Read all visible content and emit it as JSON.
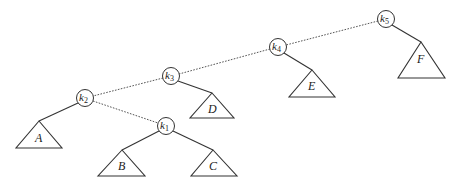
{
  "diagram": {
    "type": "binary-search-tree",
    "nodes": [
      {
        "id": "k5",
        "base": "k",
        "sub": "5",
        "cx": 386,
        "cy": 19
      },
      {
        "id": "k4",
        "base": "k",
        "sub": "4",
        "cx": 278,
        "cy": 47
      },
      {
        "id": "k3",
        "base": "k",
        "sub": "3",
        "cx": 171,
        "cy": 76
      },
      {
        "id": "k2",
        "base": "k",
        "sub": "2",
        "cx": 85,
        "cy": 98
      },
      {
        "id": "k1",
        "base": "k",
        "sub": "1",
        "cx": 166,
        "cy": 126
      }
    ],
    "subtrees": [
      {
        "id": "A",
        "label": "A",
        "parent": "k2",
        "side": "left"
      },
      {
        "id": "B",
        "label": "B",
        "parent": "k1",
        "side": "left"
      },
      {
        "id": "C",
        "label": "C",
        "parent": "k1",
        "side": "right"
      },
      {
        "id": "D",
        "label": "D",
        "parent": "k3",
        "side": "right"
      },
      {
        "id": "E",
        "label": "E",
        "parent": "k4",
        "side": "right"
      },
      {
        "id": "F",
        "label": "F",
        "parent": "k5",
        "side": "right"
      }
    ],
    "edges": [
      {
        "from": "k5",
        "to": "k4",
        "style": "dotted"
      },
      {
        "from": "k4",
        "to": "k3",
        "style": "dotted"
      },
      {
        "from": "k3",
        "to": "k2",
        "style": "dotted"
      },
      {
        "from": "k2",
        "to": "k1",
        "style": "dotted"
      },
      {
        "from": "k2",
        "to": "A",
        "style": "solid"
      },
      {
        "from": "k1",
        "to": "B",
        "style": "solid"
      },
      {
        "from": "k1",
        "to": "C",
        "style": "solid"
      },
      {
        "from": "k3",
        "to": "D",
        "style": "solid"
      },
      {
        "from": "k4",
        "to": "E",
        "style": "solid"
      },
      {
        "from": "k5",
        "to": "F",
        "style": "solid"
      }
    ]
  },
  "labels": {
    "k5": {
      "base": "k",
      "sub": "5"
    },
    "k4": {
      "base": "k",
      "sub": "4"
    },
    "k3": {
      "base": "k",
      "sub": "3"
    },
    "k2": {
      "base": "k",
      "sub": "2"
    },
    "k1": {
      "base": "k",
      "sub": "1"
    },
    "A": "A",
    "B": "B",
    "C": "C",
    "D": "D",
    "E": "E",
    "F": "F"
  }
}
